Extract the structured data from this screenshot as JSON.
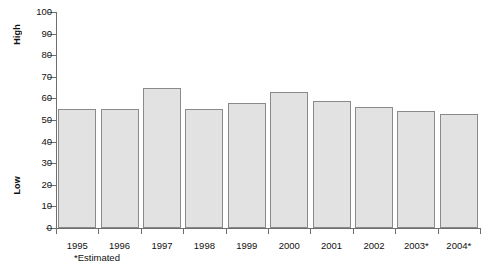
{
  "chart_data": {
    "type": "bar",
    "title": "",
    "subtitle": "",
    "xlabel": "",
    "ylabel": "",
    "categories": [
      "1995",
      "1996",
      "1997",
      "1998",
      "1999",
      "2000",
      "2001",
      "2002",
      "2003*",
      "2004*"
    ],
    "values": [
      55,
      55,
      65,
      55,
      58,
      63,
      59,
      56,
      54,
      53
    ],
    "ylim": [
      0,
      100
    ],
    "ytick_step": 10,
    "yticks": [
      100,
      90,
      80,
      70,
      60,
      50,
      40,
      30,
      20,
      10,
      0
    ],
    "ytick_labels": [
      "100",
      "90",
      "80",
      "70",
      "60",
      "50",
      "40",
      "30",
      "20",
      "10",
      "0"
    ],
    "grid": false,
    "legend": "none",
    "annotations": [
      "*Estimated"
    ],
    "axis_group_labels": {
      "top": "High",
      "bottom": "Low"
    },
    "bar_fill_color": "#e2e2e2",
    "bar_border_color": "#8a8a8a",
    "axis_color": "#6e6e6e",
    "background_color": "#ffffff"
  },
  "footnote": "*Estimated"
}
